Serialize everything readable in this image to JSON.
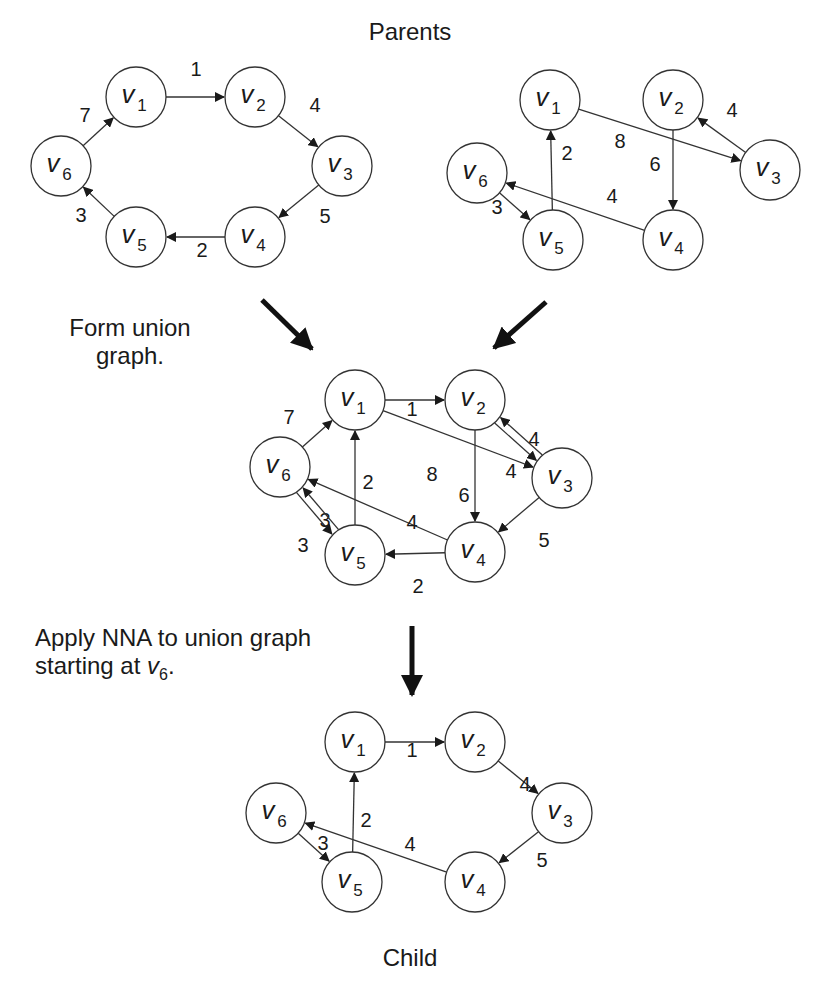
{
  "labels": {
    "parents_title": "Parents",
    "union_step_line1": "Form union",
    "union_step_line2": "graph.",
    "nna_step_line1": "Apply NNA to union graph",
    "nna_step_line2_prefix": "starting at ",
    "nna_step_start_var": "v",
    "nna_step_start_sub": "6",
    "nna_step_suffix": ".",
    "child_title": "Child"
  },
  "style": {
    "stroke": "#333333",
    "node_fill": "#ffffff",
    "text": "#1a1a1a",
    "node_radius": 30
  },
  "graphs": [
    {
      "id": "parent-1",
      "nodes": [
        {
          "id": "v1",
          "sub": "1",
          "x": 136,
          "y": 97
        },
        {
          "id": "v2",
          "sub": "2",
          "x": 255,
          "y": 97
        },
        {
          "id": "v3",
          "sub": "3",
          "x": 342,
          "y": 166
        },
        {
          "id": "v4",
          "sub": "4",
          "x": 255,
          "y": 237
        },
        {
          "id": "v5",
          "sub": "5",
          "x": 136,
          "y": 237
        },
        {
          "id": "v6",
          "sub": "6",
          "x": 61,
          "y": 166
        }
      ],
      "edges": [
        {
          "from": "v1",
          "to": "v2",
          "w": "1",
          "lx": 196,
          "ly": 76
        },
        {
          "from": "v2",
          "to": "v3",
          "w": "4",
          "lx": 315,
          "ly": 112
        },
        {
          "from": "v3",
          "to": "v4",
          "w": "5",
          "lx": 325,
          "ly": 223
        },
        {
          "from": "v4",
          "to": "v5",
          "w": "2",
          "lx": 202,
          "ly": 257
        },
        {
          "from": "v5",
          "to": "v6",
          "w": "3",
          "lx": 81,
          "ly": 222
        },
        {
          "from": "v6",
          "to": "v1",
          "w": "7",
          "lx": 85,
          "ly": 122
        }
      ]
    },
    {
      "id": "parent-2",
      "nodes": [
        {
          "id": "v1",
          "sub": "1",
          "x": 550,
          "y": 100
        },
        {
          "id": "v2",
          "sub": "2",
          "x": 673,
          "y": 100
        },
        {
          "id": "v3",
          "sub": "3",
          "x": 770,
          "y": 170
        },
        {
          "id": "v4",
          "sub": "4",
          "x": 673,
          "y": 240
        },
        {
          "id": "v5",
          "sub": "5",
          "x": 553,
          "y": 240
        },
        {
          "id": "v6",
          "sub": "6",
          "x": 477,
          "y": 173
        }
      ],
      "edges": [
        {
          "from": "v1",
          "to": "v3",
          "w": "8",
          "lx": 620,
          "ly": 148
        },
        {
          "from": "v3",
          "to": "v2",
          "w": "4",
          "lx": 732,
          "ly": 117
        },
        {
          "from": "v2",
          "to": "v4",
          "w": "6",
          "lx": 655,
          "ly": 171
        },
        {
          "from": "v4",
          "to": "v6",
          "w": "4",
          "lx": 612,
          "ly": 203
        },
        {
          "from": "v5",
          "to": "v1",
          "w": "2",
          "lx": 567,
          "ly": 160
        },
        {
          "from": "v6",
          "to": "v5",
          "w": "3",
          "lx": 497,
          "ly": 214
        }
      ]
    },
    {
      "id": "union",
      "nodes": [
        {
          "id": "v1",
          "sub": "1",
          "x": 355,
          "y": 400
        },
        {
          "id": "v2",
          "sub": "2",
          "x": 475,
          "y": 400
        },
        {
          "id": "v3",
          "sub": "3",
          "x": 562,
          "y": 478
        },
        {
          "id": "v4",
          "sub": "4",
          "x": 475,
          "y": 552
        },
        {
          "id": "v5",
          "sub": "5",
          "x": 355,
          "y": 555
        },
        {
          "id": "v6",
          "sub": "6",
          "x": 280,
          "y": 467
        }
      ],
      "edges": [
        {
          "from": "v1",
          "to": "v2",
          "w": "1",
          "lx": 412,
          "ly": 416
        },
        {
          "from": "v2",
          "to": "v3",
          "w": "4",
          "lx": 534,
          "ly": 446,
          "offset": 4
        },
        {
          "from": "v3",
          "to": "v2",
          "w": "4",
          "lx": 511,
          "ly": 478,
          "offset": 4
        },
        {
          "from": "v1",
          "to": "v3",
          "w": "8",
          "lx": 432,
          "ly": 481
        },
        {
          "from": "v2",
          "to": "v4",
          "w": "6",
          "lx": 464,
          "ly": 502
        },
        {
          "from": "v3",
          "to": "v4",
          "w": "5",
          "lx": 544,
          "ly": 547
        },
        {
          "from": "v4",
          "to": "v5",
          "w": "2",
          "lx": 418,
          "ly": 593
        },
        {
          "from": "v4",
          "to": "v6",
          "w": "4",
          "lx": 412,
          "ly": 529
        },
        {
          "from": "v5",
          "to": "v1",
          "w": "2",
          "lx": 368,
          "ly": 489
        },
        {
          "from": "v6",
          "to": "v1",
          "w": "7",
          "lx": 289,
          "ly": 424
        },
        {
          "from": "v6",
          "to": "v5",
          "w": "3",
          "lx": 325,
          "ly": 527,
          "offset": 4
        },
        {
          "from": "v5",
          "to": "v6",
          "w": "3",
          "lx": 303,
          "ly": 552,
          "offset": 4
        }
      ]
    },
    {
      "id": "child",
      "nodes": [
        {
          "id": "v1",
          "sub": "1",
          "x": 355,
          "y": 742
        },
        {
          "id": "v2",
          "sub": "2",
          "x": 475,
          "y": 742
        },
        {
          "id": "v3",
          "sub": "3",
          "x": 562,
          "y": 813
        },
        {
          "id": "v4",
          "sub": "4",
          "x": 475,
          "y": 882
        },
        {
          "id": "v5",
          "sub": "5",
          "x": 352,
          "y": 882
        },
        {
          "id": "v6",
          "sub": "6",
          "x": 276,
          "y": 813
        }
      ],
      "edges": [
        {
          "from": "v1",
          "to": "v2",
          "w": "1",
          "lx": 412,
          "ly": 757
        },
        {
          "from": "v2",
          "to": "v3",
          "w": "4",
          "lx": 525,
          "ly": 791
        },
        {
          "from": "v3",
          "to": "v4",
          "w": "5",
          "lx": 542,
          "ly": 867
        },
        {
          "from": "v4",
          "to": "v6",
          "w": "4",
          "lx": 410,
          "ly": 851
        },
        {
          "from": "v5",
          "to": "v1",
          "w": "2",
          "lx": 366,
          "ly": 827
        },
        {
          "from": "v6",
          "to": "v5",
          "w": "3",
          "lx": 323,
          "ly": 850
        }
      ]
    }
  ],
  "flow_arrows": [
    {
      "id": "parent1-to-union",
      "x1": 262,
      "y1": 300,
      "x2": 312,
      "y2": 349
    },
    {
      "id": "parent2-to-union",
      "x1": 546,
      "y1": 302,
      "x2": 494,
      "y2": 348
    },
    {
      "id": "union-to-child",
      "x1": 412,
      "y1": 626,
      "x2": 412,
      "y2": 695
    }
  ]
}
